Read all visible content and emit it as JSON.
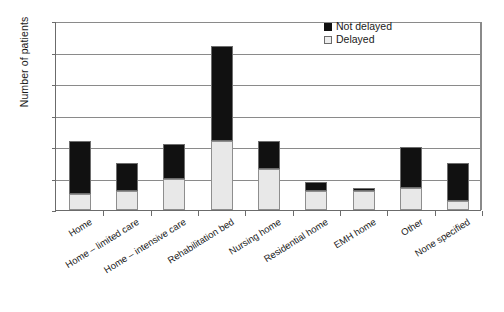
{
  "chart_data": {
    "type": "bar",
    "subtype": "stacked",
    "title": "",
    "xlabel": "",
    "ylabel": "Number of patients",
    "ylim": [
      0,
      60
    ],
    "ytick_step": 10,
    "yticks": [
      0,
      10,
      20,
      30,
      40,
      50,
      60
    ],
    "grid": "horizontal",
    "legend_position": "top-right",
    "categories": [
      "Home",
      "Home – limited care",
      "Home – intensive care",
      "Rehabilitation bed",
      "Nursing home",
      "Residential home",
      "EMH home",
      "Other",
      "None specified"
    ],
    "series": [
      {
        "name": "Delayed",
        "color": "#e8e8e8",
        "values": [
          5,
          6,
          10,
          22,
          13,
          6,
          6,
          7,
          3
        ]
      },
      {
        "name": "Not delayed",
        "color": "#111111",
        "values": [
          17,
          9,
          11,
          30,
          9,
          3,
          1,
          13,
          12
        ]
      }
    ],
    "totals": [
      22,
      15,
      21,
      52,
      22,
      9,
      7,
      20,
      15
    ]
  },
  "legend": {
    "items": [
      {
        "label": "Not delayed",
        "swatch": "black-square-icon"
      },
      {
        "label": "Delayed",
        "swatch": "light-square-icon"
      }
    ]
  },
  "axes": {
    "y_title": "Number of patients",
    "y_tick_labels": [
      "0",
      "10",
      "20",
      "30",
      "40",
      "50",
      "60"
    ]
  }
}
